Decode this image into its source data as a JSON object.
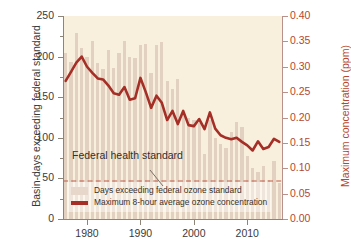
{
  "chart_data": {
    "type": "bar",
    "title": "",
    "subtitle": "",
    "xlabel": "",
    "ylabel": "Basin-days exceeding federal standard",
    "y2label": "Maximum concentration (ppm)",
    "xlim": [
      1975.5,
      2016.5
    ],
    "ylim": [
      0,
      250
    ],
    "y2lim": [
      0.0,
      0.4
    ],
    "grid": false,
    "legend_position": "bottom-left-inside",
    "x_ticks": [
      "1980",
      "1990",
      "2000",
      "2010"
    ],
    "x_tick_values": [
      1980,
      1990,
      2000,
      2010
    ],
    "y_ticks": [
      "0",
      "50",
      "100",
      "150",
      "200",
      "250"
    ],
    "y_tick_values": [
      0,
      50,
      100,
      150,
      200,
      250
    ],
    "y_minor_tick_values": [
      25,
      75,
      125,
      175,
      225
    ],
    "y2_ticks": [
      "0.00",
      "0.05",
      "0.10",
      "0.15",
      "0.20",
      "0.25",
      "0.30",
      "0.35",
      "0.40"
    ],
    "y2_tick_values": [
      0.0,
      0.05,
      0.1,
      0.15,
      0.2,
      0.25,
      0.3,
      0.35,
      0.4
    ],
    "x": [
      1976,
      1977,
      1978,
      1979,
      1980,
      1981,
      1982,
      1983,
      1984,
      1985,
      1986,
      1987,
      1988,
      1989,
      1990,
      1991,
      1992,
      1993,
      1994,
      1995,
      1996,
      1997,
      1998,
      1999,
      2000,
      2001,
      2002,
      2003,
      2004,
      2005,
      2006,
      2007,
      2008,
      2009,
      2010,
      2011,
      2012,
      2013,
      2014,
      2015,
      2016
    ],
    "series": [
      {
        "name": "Days exceeding federal ozone standard",
        "type": "bar",
        "axis": "left",
        "unit": "basin-days",
        "color": "#e2d0c1",
        "values": [
          205,
          193,
          229,
          210,
          200,
          219,
          192,
          185,
          208,
          186,
          204,
          219,
          200,
          198,
          214,
          216,
          180,
          214,
          218,
          170,
          160,
          172,
          132,
          124,
          122,
          118,
          80,
          122,
          100,
          92,
          88,
          107,
          120,
          113,
          78,
          63,
          58,
          65,
          48,
          72,
          44
        ]
      },
      {
        "name": "Maximum 8-hour average ozone concentration",
        "type": "line",
        "axis": "right",
        "unit": "ppm",
        "color": "#a52f26",
        "values": [
          0.272,
          0.29,
          0.308,
          0.32,
          0.3,
          0.288,
          0.277,
          0.275,
          0.263,
          0.248,
          0.245,
          0.26,
          0.235,
          0.238,
          0.278,
          0.25,
          0.219,
          0.243,
          0.229,
          0.195,
          0.213,
          0.187,
          0.213,
          0.185,
          0.183,
          0.197,
          0.177,
          0.21,
          0.178,
          0.165,
          0.16,
          0.157,
          0.16,
          0.152,
          0.145,
          0.135,
          0.153,
          0.138,
          0.142,
          0.158,
          0.152
        ]
      }
    ],
    "reference_line": {
      "label": "Federal health standard",
      "value_ppm": 0.075,
      "value_left_axis": 45,
      "style": "dashed",
      "color": "#c05a4a"
    },
    "colors": {
      "plot_background": "#f8f0dd",
      "bar": "#e2d0c1",
      "line": "#a52f26",
      "left_axis": "#8d8579",
      "right_axis": "#b5472f",
      "reference_line": "#c05a4a"
    }
  },
  "legend": {
    "items": [
      {
        "swatch": "bar-swatch",
        "label": "Days exceeding federal ozone standard"
      },
      {
        "swatch": "line-swatch",
        "label": "Maximum 8-hour average ozone concentration"
      }
    ]
  }
}
